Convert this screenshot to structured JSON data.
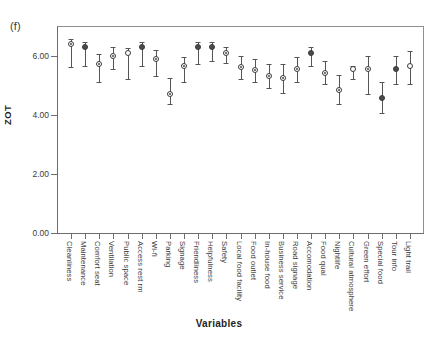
{
  "figure": {
    "panel_label": "(f)"
  },
  "chart_data": {
    "type": "scatter",
    "title": "",
    "xlabel": "Variables",
    "ylabel": "ZOT",
    "ylim": [
      0.0,
      7.0
    ],
    "yticks": [
      "0.00",
      "2.00",
      "4.00",
      "6.00"
    ],
    "ytick_values": [
      0.0,
      2.0,
      4.0,
      6.0
    ],
    "grid": false,
    "legend": null,
    "error_bars": "vertical ranges with caps",
    "categories": [
      "Cleanliness",
      "Maintenance",
      "Comfort seat",
      "Ventilation",
      "Public space",
      "Access rest rm",
      "Wi-fi",
      "Parking",
      "Signage",
      "Friendliness",
      "Helpfulness",
      "Safety",
      "Local food facility",
      "Food outlet",
      "In-house food",
      "Business service",
      "Road signage",
      "Accomodation",
      "Food qual",
      "Nightlife",
      "Cultural atmosphere",
      "Green effort",
      "Special food",
      "Tour info",
      "Light trail"
    ],
    "values": [
      6.4,
      6.3,
      5.7,
      6.0,
      6.1,
      6.3,
      5.9,
      4.7,
      5.65,
      6.3,
      6.3,
      6.1,
      5.6,
      5.5,
      5.3,
      5.25,
      5.55,
      6.1,
      5.4,
      4.85,
      5.55,
      5.55,
      4.55,
      5.55,
      5.65
    ],
    "lower": [
      5.6,
      5.65,
      5.1,
      5.55,
      5.2,
      5.65,
      5.3,
      4.35,
      5.1,
      5.7,
      5.8,
      5.75,
      5.2,
      5.1,
      4.9,
      4.75,
      5.1,
      5.65,
      5.05,
      4.35,
      5.2,
      4.7,
      4.05,
      5.05,
      5.05
    ],
    "upper": [
      6.55,
      6.45,
      6.05,
      6.3,
      6.25,
      6.45,
      6.2,
      5.25,
      5.95,
      6.45,
      6.45,
      6.3,
      6.0,
      5.9,
      5.7,
      5.7,
      5.95,
      6.3,
      5.8,
      5.35,
      5.65,
      6.0,
      5.1,
      6.0,
      6.15
    ],
    "marker_styles": [
      "dotted",
      "filled",
      "dotted",
      "dotted",
      "hollow",
      "filled",
      "dotted",
      "dotted",
      "dotted",
      "filled",
      "filled",
      "dotted",
      "dotted",
      "dotted",
      "dotted",
      "dotted",
      "dotted",
      "filled",
      "dotted",
      "dotted",
      "hollow",
      "dotted",
      "filled",
      "filled",
      "hollow"
    ]
  }
}
